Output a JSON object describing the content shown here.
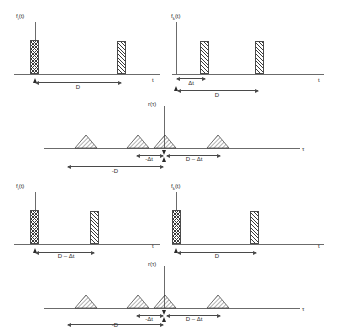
{
  "figure": {
    "panels": [
      {
        "id": "top-left",
        "signal_label": "f",
        "signal_sub": "i",
        "signal_suffix": "(t)",
        "axis_label": "t",
        "pulses": [
          {
            "position": "0",
            "hatch": "cross"
          },
          {
            "position": "D",
            "hatch": "diag"
          }
        ],
        "measures": [
          {
            "label": "D"
          }
        ]
      },
      {
        "id": "top-right",
        "signal_label": "f",
        "signal_sub": "k",
        "signal_suffix": "(t)",
        "axis_label": "t",
        "pulses": [
          {
            "position": "Δt",
            "hatch": "diag"
          },
          {
            "position": "D + Δt",
            "hatch": "diag"
          }
        ],
        "measures": [
          {
            "label": "Δt"
          },
          {
            "label": "D"
          }
        ]
      },
      {
        "id": "top-correlation",
        "signal_label": "r",
        "signal_sub": "",
        "signal_suffix": "(τ)",
        "axis_label": "τ",
        "peaks": [
          {
            "position": "-D-Δt"
          },
          {
            "position": "-Δt"
          },
          {
            "position": "0"
          },
          {
            "position": "D-Δt"
          }
        ],
        "measures": [
          {
            "label": "-Δt"
          },
          {
            "label": "D – Δt"
          },
          {
            "label": "-D"
          }
        ]
      },
      {
        "id": "bottom-left",
        "signal_label": "f",
        "signal_sub": "i",
        "signal_suffix": "(t)",
        "axis_label": "t",
        "pulses": [
          {
            "position": "0",
            "hatch": "cross"
          },
          {
            "position": "D - Δt",
            "hatch": "diag"
          }
        ],
        "measures": [
          {
            "label": "D – Δt"
          }
        ]
      },
      {
        "id": "bottom-right",
        "signal_label": "f",
        "signal_sub": "k",
        "signal_suffix": "(t)",
        "axis_label": "t",
        "pulses": [
          {
            "position": "0",
            "hatch": "cross"
          },
          {
            "position": "D",
            "hatch": "diag"
          }
        ],
        "measures": [
          {
            "label": "D"
          }
        ]
      },
      {
        "id": "bottom-correlation",
        "signal_label": "r",
        "signal_sub": "",
        "signal_suffix": "(τ)",
        "axis_label": "τ",
        "peaks": [
          {
            "position": "-D-Δt"
          },
          {
            "position": "-Δt"
          },
          {
            "position": "0"
          },
          {
            "position": "D-Δt"
          }
        ],
        "measures": [
          {
            "label": "-Δt"
          },
          {
            "label": "D – Δt"
          },
          {
            "label": "-D"
          }
        ]
      }
    ],
    "labels": {
      "f_i_t": "f",
      "f_k_t": "f",
      "r_tau": "r",
      "sub_i": "i",
      "sub_k": "k",
      "paren_t": "(t)",
      "paren_tau": "(τ)",
      "t_axis": "t",
      "tau_axis": "τ",
      "D": "D",
      "dt": "Δt",
      "neg_dt": "-Δt",
      "D_minus_dt": "D – Δt",
      "neg_D": "-D"
    },
    "colors": {
      "line": "#6b6b6b",
      "hatch": "#3a3a3a",
      "text": "#2a2a2a",
      "background": "#ffffff"
    }
  }
}
